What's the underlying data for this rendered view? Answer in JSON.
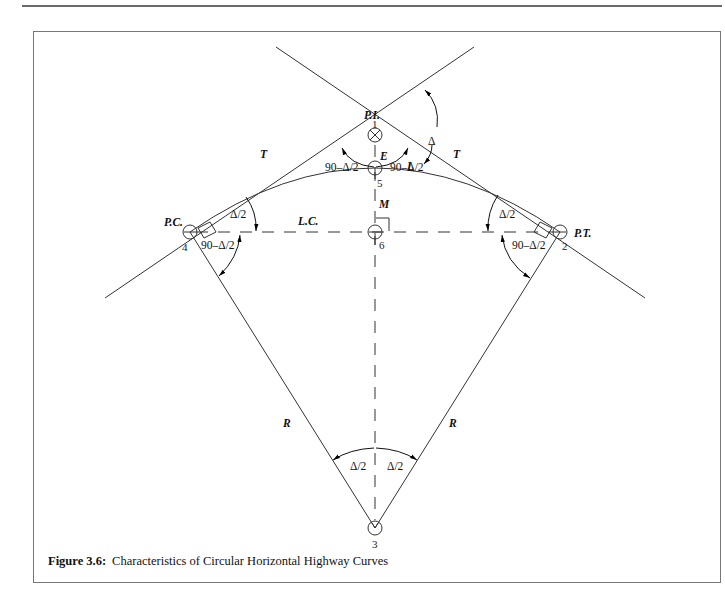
{
  "figure": {
    "number_label": "Figure 3.6:",
    "caption": "Characteristics of Circular Horizontal Highway Curves",
    "points": {
      "pi": {
        "label": "P.I.",
        "number": "1"
      },
      "pt": {
        "label": "P.T.",
        "number": "2"
      },
      "center": {
        "number": "3"
      },
      "pc": {
        "label": "P.C.",
        "number": "4"
      },
      "curve_mid": {
        "number": "5"
      },
      "chord_mid": {
        "number": "6"
      }
    },
    "labels": {
      "tangent_left": "T",
      "tangent_right": "T",
      "external": "E",
      "length": "L",
      "middle_ordinate": "M",
      "long_chord": "L.C.",
      "radius_left": "R",
      "radius_right": "R",
      "deflection": "Δ",
      "pi_angle_left": "90–Δ/2",
      "pi_angle_right": "90–Δ/2",
      "pc_chord_angle": "Δ/2",
      "pc_radius_angle": "90–Δ/2",
      "pt_chord_angle": "Δ/2",
      "pt_radius_angle": "90–Δ/2",
      "center_angle_left": "Δ/2",
      "center_angle_right": "Δ/2"
    }
  }
}
